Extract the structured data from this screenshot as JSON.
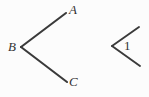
{
  "canvas": {
    "width": 149,
    "height": 97,
    "background_color": "#fcfcfc",
    "stroke_color": "#3a3a3a",
    "label_color": "#333333"
  },
  "figures": [
    {
      "id": "angle-abc",
      "name": "Angle ABC",
      "vertex": {
        "label": "B",
        "x": 21,
        "y": 47
      },
      "rays": [
        {
          "name": "ray-BA",
          "to_label": "A",
          "x1": 21,
          "y1": 47,
          "x2": 66,
          "y2": 13
        },
        {
          "name": "ray-BC",
          "to_label": "C",
          "x1": 21,
          "y1": 47,
          "x2": 67,
          "y2": 82
        }
      ],
      "labels": [
        {
          "id": "A",
          "text": "A",
          "x": 69,
          "y": 3,
          "style": "italic"
        },
        {
          "id": "B",
          "text": "B",
          "x": 8,
          "y": 40,
          "style": "italic"
        },
        {
          "id": "C",
          "text": "C",
          "x": 69,
          "y": 75,
          "style": "italic"
        }
      ]
    },
    {
      "id": "angle-1",
      "name": "Angle 1",
      "vertex": {
        "label": "1",
        "x": 112,
        "y": 46
      },
      "rays": [
        {
          "name": "ray-upper",
          "to_label": "",
          "x1": 112,
          "y1": 46,
          "x2": 139,
          "y2": 27
        },
        {
          "name": "ray-lower",
          "to_label": "",
          "x1": 112,
          "y1": 46,
          "x2": 140,
          "y2": 66
        }
      ],
      "labels": [
        {
          "id": "1",
          "text": "1",
          "x": 124,
          "y": 39,
          "style": "upright"
        }
      ]
    }
  ],
  "labels": {
    "A": "A",
    "B": "B",
    "C": "C",
    "one": "1"
  }
}
